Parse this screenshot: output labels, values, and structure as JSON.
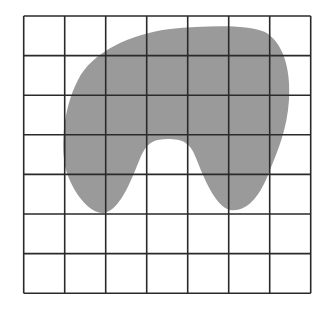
{
  "diagram": {
    "grid": {
      "rows": 7,
      "columns": 7,
      "left": 23.7,
      "top": 16,
      "cell_width": 41.0,
      "cell_height": 39.6,
      "line_color": "#2a2a2a"
    },
    "shape": {
      "fill_color": "#9a9a9a",
      "path": "M 78 80 C 92 52, 130 34, 170 29 C 205 26, 245 24, 265 32 C 282 42, 291 66, 289 100 C 287 130, 278 150, 268 175 C 258 200, 245 212, 230 210 C 215 206, 204 178, 196 158 C 190 142, 182 139, 168 139 C 155 139, 148 142, 142 154 C 134 172, 122 210, 104 213 C 88 214, 72 190, 66 170 C 61 150, 62 110, 78 80 Z"
    }
  }
}
